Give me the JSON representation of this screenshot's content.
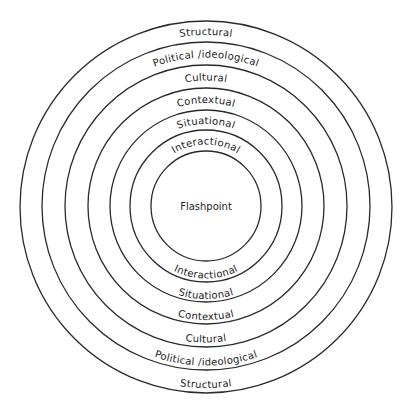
{
  "diagram": {
    "center_label": "Flashpoint",
    "center": [
      206,
      206
    ],
    "rings": [
      186,
      164,
      141,
      118,
      96,
      76,
      55
    ],
    "stroke_color": "#2a2a2a",
    "levels": [
      {
        "label": "Structural",
        "top_label": "Structural",
        "bottom_label": "Structural"
      },
      {
        "label": "Political /ideological",
        "top_label": "Political /ideological",
        "bottom_label": "Political /ideological"
      },
      {
        "label": "Cultural",
        "top_label": "Cultural",
        "bottom_label": "Cultural"
      },
      {
        "label": "Contextual",
        "top_label": "Contextual",
        "bottom_label": "Contextual"
      },
      {
        "label": "Situational",
        "top_label": "Situational",
        "bottom_label": "Situational"
      },
      {
        "label": "Interactional",
        "top_label": "Interactional",
        "bottom_label": "Interactional"
      }
    ]
  }
}
